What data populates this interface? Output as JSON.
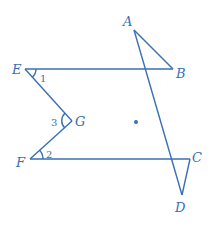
{
  "diagram": {
    "color": "#3a6fb3",
    "points": {
      "A": {
        "label": "A",
        "x": 134,
        "y": 30
      },
      "B": {
        "label": "B",
        "x": 173,
        "y": 69
      },
      "C": {
        "label": "C",
        "x": 190,
        "y": 159
      },
      "D": {
        "label": "D",
        "x": 182,
        "y": 195
      },
      "E": {
        "label": "E",
        "x": 25,
        "y": 69
      },
      "F": {
        "label": "F",
        "x": 30,
        "y": 159
      },
      "G": {
        "label": "G",
        "x": 72,
        "y": 121
      }
    },
    "segments": [
      [
        "E",
        "B"
      ],
      [
        "A",
        "B"
      ],
      [
        "A",
        "D"
      ],
      [
        "C",
        "D"
      ],
      [
        "F",
        "C"
      ],
      [
        "E",
        "G"
      ],
      [
        "G",
        "F"
      ]
    ],
    "angles": [
      {
        "label": "1",
        "vertex": "E"
      },
      {
        "label": "2",
        "vertex": "F"
      },
      {
        "label": "3",
        "vertex": "G"
      }
    ],
    "dot": {
      "x": 136,
      "y": 122
    }
  }
}
